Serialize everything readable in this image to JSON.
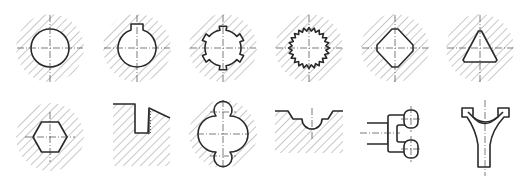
{
  "sheet": {
    "title": "Cross-section profiles",
    "colors": {
      "line": "#2a2a2a",
      "hatch": "#9a9a9a",
      "background": "#ffffff"
    }
  },
  "profiles": [
    {
      "id": "round-bore",
      "label": "Round hole",
      "row": 1,
      "col": 1
    },
    {
      "id": "keyway-bore",
      "label": "Round hole with keyway",
      "row": 1,
      "col": 2
    },
    {
      "id": "spline-bore",
      "label": "Rectangular spline hole",
      "row": 1,
      "col": 3
    },
    {
      "id": "serration-bore",
      "label": "Serrated (involute) spline hole",
      "row": 1,
      "col": 4
    },
    {
      "id": "square-bore",
      "label": "Square hole (rounded corners)",
      "row": 1,
      "col": 5
    },
    {
      "id": "triangle-bore",
      "label": "Triangular hole",
      "row": 1,
      "col": 6
    },
    {
      "id": "hex-bore",
      "label": "Hexagonal hole",
      "row": 2,
      "col": 1
    },
    {
      "id": "step-slot",
      "label": "Stepped slot with thread",
      "row": 2,
      "col": 2
    },
    {
      "id": "triple-circle",
      "label": "Three overlapping circles",
      "row": 2,
      "col": 3
    },
    {
      "id": "groove",
      "label": "Stepped groove with arc",
      "row": 2,
      "col": 4
    },
    {
      "id": "fork-joint",
      "label": "Fork (clevis) joint",
      "row": 2,
      "col": 5
    },
    {
      "id": "shift-fork",
      "label": "Shift fork",
      "row": 2,
      "col": 6
    }
  ]
}
